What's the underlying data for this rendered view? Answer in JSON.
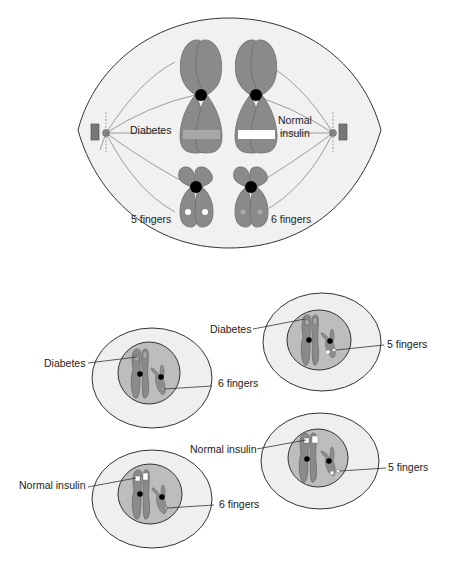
{
  "diagram": {
    "type": "meiosis-chromosome-segregation",
    "colors": {
      "cell_fill": "#efefef",
      "nucleus_fill": "#bdbdbd",
      "chromosome": "#8a8a8a",
      "centromere": "#000000",
      "diabetes_band": "#a8a8a8",
      "normal_band": "#ffffff",
      "outline": "#333333"
    },
    "metaphase_cell": {
      "labels": {
        "diabetes": "Diabetes",
        "normal_insulin_line1": "Normal",
        "normal_insulin_line2": "insulin",
        "five_fingers": "5 fingers",
        "six_fingers": "6 fingers"
      }
    },
    "daughter_cells": [
      {
        "id": "cell-1",
        "labels": [
          "Diabetes",
          "6 fingers"
        ]
      },
      {
        "id": "cell-2",
        "labels": [
          "Diabetes",
          "5 fingers"
        ]
      },
      {
        "id": "cell-3",
        "labels": [
          "Normal insulin",
          "6 fingers"
        ]
      },
      {
        "id": "cell-4",
        "labels": [
          "Normal insulin",
          "5 fingers"
        ]
      }
    ]
  }
}
